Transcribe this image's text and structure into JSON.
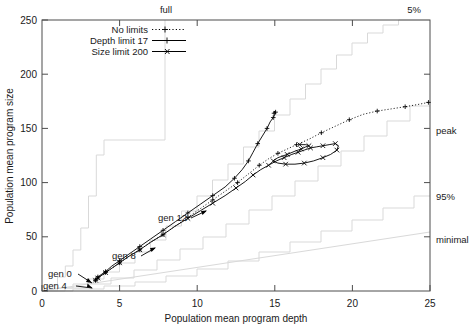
{
  "chart_data": {
    "type": "line",
    "title": "",
    "xlabel": "Population mean program depth",
    "ylabel": "Population mean program size",
    "xlim": [
      0,
      25
    ],
    "ylim": [
      0,
      250
    ],
    "xticks": [
      0,
      5,
      10,
      15,
      20,
      25
    ],
    "yticks": [
      0,
      50,
      100,
      150,
      200,
      250
    ],
    "grid": false,
    "legend_position": "top-left-inside",
    "series": [
      {
        "name": "No limits",
        "style": "dotted",
        "marker": "plus",
        "color": "#000000",
        "points": [
          [
            3.45,
            10
          ],
          [
            3.5,
            11
          ],
          [
            3.6,
            12
          ],
          [
            3.8,
            14
          ],
          [
            4.1,
            17
          ],
          [
            4.5,
            21
          ],
          [
            5.0,
            26
          ],
          [
            5.6,
            32
          ],
          [
            6.3,
            38
          ],
          [
            7.0,
            45
          ],
          [
            7.8,
            52
          ],
          [
            8.6,
            60
          ],
          [
            9.4,
            68
          ],
          [
            10.2,
            76
          ],
          [
            11.0,
            84
          ],
          [
            11.8,
            92
          ],
          [
            12.6,
            100
          ],
          [
            13.3,
            108
          ],
          [
            14.0,
            116
          ],
          [
            14.6,
            122
          ],
          [
            15.2,
            127
          ],
          [
            15.8,
            131
          ],
          [
            16.4,
            135
          ],
          [
            17.2,
            140
          ],
          [
            18.0,
            146
          ],
          [
            18.9,
            152
          ],
          [
            19.8,
            158
          ],
          [
            20.7,
            163
          ],
          [
            21.6,
            166
          ],
          [
            22.5,
            168
          ],
          [
            23.4,
            170
          ],
          [
            24.2,
            172
          ],
          [
            24.9,
            174
          ]
        ]
      },
      {
        "name": "Depth limit 17",
        "style": "solid",
        "marker": "plus",
        "color": "#000000",
        "points": [
          [
            3.45,
            10
          ],
          [
            3.5,
            11
          ],
          [
            3.6,
            13
          ],
          [
            3.8,
            15
          ],
          [
            4.1,
            18
          ],
          [
            4.5,
            23
          ],
          [
            5.0,
            28
          ],
          [
            5.6,
            34
          ],
          [
            6.3,
            41
          ],
          [
            7.0,
            48
          ],
          [
            7.8,
            56
          ],
          [
            8.6,
            64
          ],
          [
            9.4,
            72
          ],
          [
            10.2,
            80
          ],
          [
            11.0,
            88
          ],
          [
            11.8,
            96
          ],
          [
            12.4,
            104
          ],
          [
            12.9,
            112
          ],
          [
            13.3,
            120
          ],
          [
            13.6,
            128
          ],
          [
            13.9,
            136
          ],
          [
            14.2,
            143
          ],
          [
            14.5,
            150
          ],
          [
            14.7,
            156
          ],
          [
            14.9,
            160
          ],
          [
            15.0,
            163
          ],
          [
            15.05,
            165
          ],
          [
            15.0,
            166
          ],
          [
            14.95,
            164
          ]
        ]
      },
      {
        "name": "Size limit 200",
        "style": "solid",
        "marker": "cross",
        "color": "#000000",
        "points": [
          [
            3.45,
            10
          ],
          [
            3.5,
            11
          ],
          [
            3.6,
            12
          ],
          [
            3.8,
            14
          ],
          [
            4.1,
            17
          ],
          [
            4.5,
            21
          ],
          [
            5.0,
            26
          ],
          [
            5.6,
            32
          ],
          [
            6.3,
            38
          ],
          [
            7.0,
            45
          ],
          [
            7.8,
            52
          ],
          [
            8.6,
            60
          ],
          [
            9.4,
            67
          ],
          [
            10.2,
            74
          ],
          [
            11.0,
            81
          ],
          [
            11.8,
            88
          ],
          [
            12.5,
            95
          ],
          [
            13.1,
            101
          ],
          [
            13.6,
            107
          ],
          [
            14.1,
            112
          ],
          [
            14.6,
            116
          ],
          [
            15.1,
            120
          ],
          [
            15.6,
            123
          ],
          [
            16.1,
            126
          ],
          [
            16.5,
            128
          ],
          [
            16.9,
            130
          ],
          [
            17.3,
            132
          ],
          [
            17.7,
            133
          ],
          [
            18.1,
            134
          ],
          [
            18.5,
            135
          ],
          [
            18.9,
            136
          ],
          [
            19.1,
            134
          ],
          [
            19.0,
            130
          ],
          [
            18.6,
            126
          ],
          [
            18.1,
            123
          ],
          [
            17.5,
            120
          ],
          [
            16.9,
            118
          ],
          [
            16.3,
            117
          ],
          [
            15.7,
            117
          ],
          [
            15.2,
            118
          ],
          [
            14.9,
            120
          ],
          [
            15.2,
            123
          ],
          [
            15.8,
            126
          ],
          [
            16.3,
            129
          ],
          [
            16.7,
            131
          ],
          [
            17.0,
            133
          ],
          [
            17.2,
            134
          ],
          [
            17.0,
            135
          ],
          [
            16.6,
            135
          ]
        ]
      }
    ],
    "reference_lines": [
      {
        "name": "full",
        "label": "full",
        "label_x": 6.9,
        "style": "step"
      },
      {
        "name": "5%",
        "label": "5%",
        "label_x": 24.0,
        "style": "step"
      },
      {
        "name": "peak",
        "label": "peak",
        "label_y": 140,
        "style": "step"
      },
      {
        "name": "95%",
        "label": "95%",
        "label_y": 78,
        "style": "step"
      },
      {
        "name": "minimal",
        "label": "minimal",
        "label_y": 52,
        "style": "line"
      }
    ],
    "annotations": [
      {
        "label": "gen 0",
        "text_x": 48,
        "text_y": 277,
        "arrow_to_x": 90,
        "arrow_to_y": 288
      },
      {
        "label": "gen 4",
        "text_x": 43,
        "text_y": 288,
        "arrow_to_x": 90,
        "arrow_to_y": 289
      },
      {
        "label": "gen 8",
        "text_x": 112,
        "text_y": 259,
        "arrow_to_x": 143,
        "arrow_to_y": 252
      },
      {
        "label": "gen 12",
        "text_x": 160,
        "text_y": 221,
        "arrow_to_x": 196,
        "arrow_to_y": 214
      }
    ],
    "legend_entries": [
      {
        "label": "No limits",
        "style": "dotted",
        "marker": "plus"
      },
      {
        "label": "Depth limit 17",
        "style": "solid",
        "marker": "plus"
      },
      {
        "label": "Size limit 200",
        "style": "solid",
        "marker": "cross"
      }
    ],
    "axis_colors": {
      "axis": "#4d4d4d",
      "reference": "#d8d8d8",
      "data": "#000000"
    }
  },
  "xticks": {
    "t0": "0",
    "t1": "5",
    "t2": "10",
    "t3": "15",
    "t4": "20",
    "t5": "25"
  },
  "yticks": {
    "t0": "0",
    "t1": "50",
    "t2": "100",
    "t3": "150",
    "t4": "200",
    "t5": "250"
  },
  "labels": {
    "x_axis": "Population mean program depth",
    "y_axis": "Population mean program size",
    "full": "full",
    "five_pct": "5%",
    "peak": "peak",
    "ninetyfive_pct": "95%",
    "minimal": "minimal"
  },
  "legend": {
    "e0": "No limits",
    "e1": "Depth limit 17",
    "e2": "Size limit 200"
  },
  "annotations": {
    "a0": "gen 0",
    "a1": "gen 4",
    "a2": "gen 8",
    "a3": "gen 12"
  }
}
